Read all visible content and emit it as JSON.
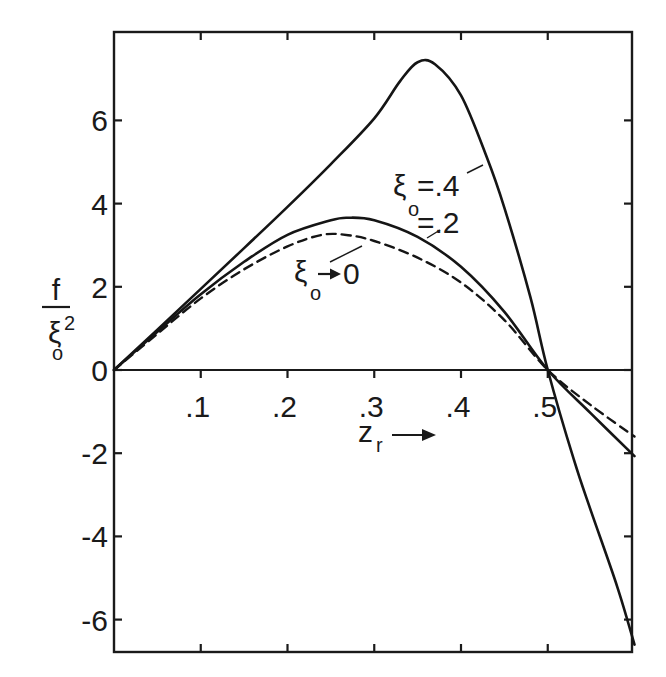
{
  "chart_data": {
    "type": "line",
    "title": "",
    "xlabel": "z_r →",
    "ylabel": "f / ξo²",
    "xlim": [
      0,
      0.6
    ],
    "ylim": [
      -6.7,
      8.0
    ],
    "grid": false,
    "x_ticks": [
      0.1,
      0.2,
      0.3,
      0.4,
      0.5
    ],
    "x_tick_labels": [
      ".1",
      ".2",
      ".3",
      ".4",
      ".5"
    ],
    "y_ticks": [
      -6,
      -4,
      -2,
      0,
      2,
      4,
      6
    ],
    "y_tick_labels": [
      "-6",
      "-4",
      "-2",
      "0",
      "2",
      "4",
      "6"
    ],
    "legend": "inline annotations",
    "series": [
      {
        "name": "ξo = .4",
        "style": "solid",
        "x": [
          0,
          0.05,
          0.1,
          0.15,
          0.2,
          0.25,
          0.3,
          0.33,
          0.35,
          0.37,
          0.4,
          0.43,
          0.45,
          0.48,
          0.5,
          0.53,
          0.55,
          0.58,
          0.6
        ],
        "y": [
          0,
          0.97,
          1.95,
          2.93,
          3.92,
          4.95,
          6.05,
          6.95,
          7.4,
          7.35,
          6.6,
          5.1,
          3.9,
          1.75,
          0,
          -2.15,
          -3.4,
          -5.2,
          -6.6
        ]
      },
      {
        "name": "ξo = .2",
        "style": "solid",
        "x": [
          0,
          0.05,
          0.1,
          0.15,
          0.2,
          0.25,
          0.27,
          0.3,
          0.35,
          0.4,
          0.45,
          0.5,
          0.55,
          0.6
        ],
        "y": [
          0,
          0.92,
          1.82,
          2.6,
          3.25,
          3.6,
          3.66,
          3.6,
          3.2,
          2.48,
          1.4,
          0,
          -1.05,
          -2.07
        ]
      },
      {
        "name": "ξo → 0",
        "style": "dashed",
        "x": [
          0,
          0.05,
          0.1,
          0.15,
          0.2,
          0.24,
          0.27,
          0.3,
          0.35,
          0.4,
          0.45,
          0.5,
          0.55,
          0.6
        ],
        "y": [
          0,
          0.87,
          1.72,
          2.42,
          2.97,
          3.25,
          3.24,
          3.1,
          2.7,
          2.1,
          1.2,
          0,
          -0.85,
          -1.6
        ]
      }
    ],
    "annotations": [
      {
        "text": "ξo=.4",
        "main": "ξ",
        "sub": "o",
        "rest": "=.4",
        "target_series": "ξo = .4"
      },
      {
        "text": "=.2",
        "main": "",
        "sub": "",
        "rest": "=.2",
        "target_series": "ξo = .2"
      },
      {
        "text": "ξo→0",
        "main": "ξ",
        "sub": "o",
        "rest": "→0",
        "target_series": "ξo → 0"
      }
    ]
  },
  "labels": {
    "ylabel_num": "f",
    "ylabel_den_main": "ξ",
    "ylabel_den_sub": "o",
    "ylabel_den_sup": "2",
    "xlabel_main": "z",
    "xlabel_sub": "r",
    "ann_04_main": "ξ",
    "ann_04_sub": "o",
    "ann_04_rest": "=.4",
    "ann_02_rest": "=.2",
    "ann_0_main": "ξ",
    "ann_0_sub": "o",
    "ann_0_rest": "0"
  }
}
